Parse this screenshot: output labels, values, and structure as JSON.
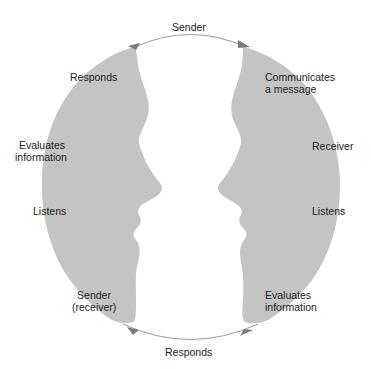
{
  "diagram": {
    "colors": {
      "face_fill": "#c4c4c4",
      "circle_stroke": "#9a9a9a",
      "arrow": "#7a7a7a",
      "text": "#222222",
      "background": "#ffffff"
    },
    "top_arc_label": "Sender",
    "bottom_arc_label": "Responds",
    "left_face": {
      "role": "sender-receiver",
      "labels": {
        "responds": "Responds",
        "evaluates_line1": "Evaluates",
        "evaluates_line2": "information",
        "listens": "Listens",
        "sender_line1": "Sender",
        "sender_line2": "(receiver)"
      }
    },
    "right_face": {
      "role": "receiver",
      "labels": {
        "communicates_line1": "Communicates",
        "communicates_line2": "a message",
        "receiver": "Receiver",
        "listens": "Listens",
        "evaluates_line1": "Evaluates",
        "evaluates_line2": "information"
      }
    },
    "arrows": [
      {
        "position": "top-left",
        "direction": "up-right"
      },
      {
        "position": "top-right",
        "direction": "right-down"
      },
      {
        "position": "bottom-right",
        "direction": "down-left"
      },
      {
        "position": "bottom-left",
        "direction": "left-up"
      }
    ]
  }
}
